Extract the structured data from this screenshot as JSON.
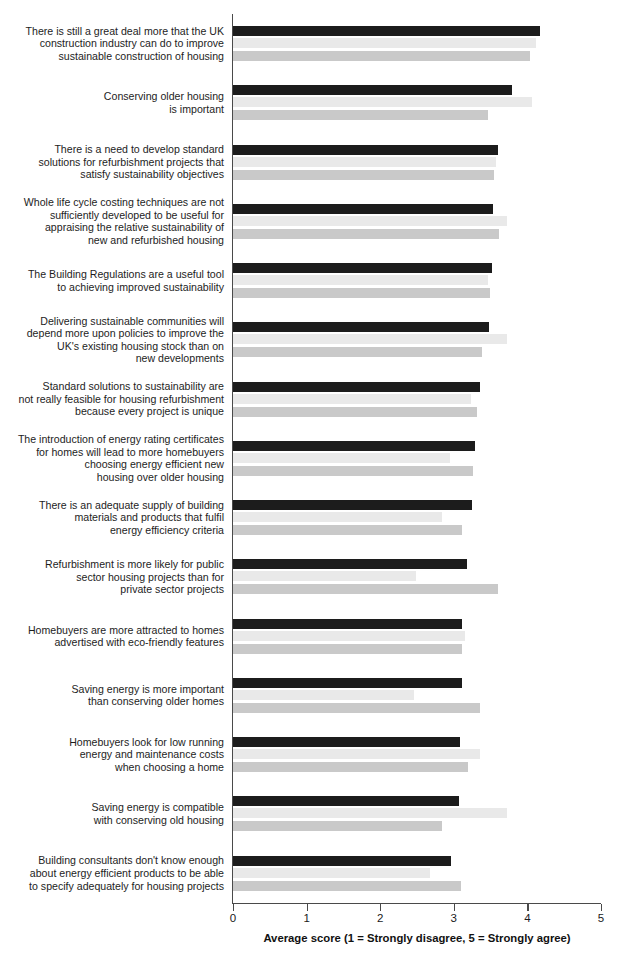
{
  "chart_data": {
    "type": "bar",
    "orientation": "horizontal",
    "title": "",
    "subtitle": "",
    "xlabel": "Average score (1 = Strongly disagree, 5 = Strongly agree)",
    "ylabel": "",
    "xlim": [
      0,
      5
    ],
    "xticks": [
      0,
      1,
      2,
      3,
      4,
      5
    ],
    "xtick_labels": [
      "0",
      "1",
      "2",
      "3",
      "4",
      "5"
    ],
    "grid": false,
    "legend": "none",
    "colors": {
      "series_1": "#1c1c1c",
      "series_2": "#e9e9e9",
      "series_3": "#c9c9c9",
      "axis": "#4a4a4a",
      "text": "#1d1d1d",
      "background": "#ffffff"
    },
    "categories": [
      [
        "There is still a great deal more that the UK",
        "construction industry can do to improve",
        "sustainable construction of housing"
      ],
      [
        "Conserving older housing",
        "is important"
      ],
      [
        "There is a need to develop standard",
        "solutions for refurbishment projects that",
        "satisfy sustainability objectives"
      ],
      [
        "Whole life cycle costing techniques are not",
        "sufficiently developed to be useful for",
        "appraising the relative sustainability of",
        "new and refurbished housing"
      ],
      [
        "The Building Regulations are a useful tool",
        "to achieving improved sustainability"
      ],
      [
        "Delivering sustainable communities will",
        "depend more upon policies to improve the",
        "UK's existing housing stock than on",
        "new developments"
      ],
      [
        "Standard solutions to sustainability are",
        "not really feasible for housing refurbishment",
        "because every project is unique"
      ],
      [
        "The introduction of energy rating certificates",
        "for homes will lead to more homebuyers",
        "choosing energy efficient new",
        "housing over older housing"
      ],
      [
        "There is an adequate supply of building",
        "materials and products that fulfil",
        "energy efficiency criteria"
      ],
      [
        "Refurbishment is more likely for public",
        "sector housing projects than for",
        "private sector projects"
      ],
      [
        "Homebuyers are more attracted to homes",
        "advertised with eco-friendly features"
      ],
      [
        "Saving energy is more important",
        "than conserving older homes"
      ],
      [
        "Homebuyers look for low running",
        "energy and maintenance costs",
        "when choosing a home"
      ],
      [
        "Saving energy is compatible",
        "with conserving old housing"
      ],
      [
        "Building consultants don't know enough",
        "about energy efficient products to be able",
        "to specify adequately for housing projects"
      ]
    ],
    "series": [
      {
        "name": "series_1",
        "color": "#1c1c1c",
        "values": [
          4.17,
          3.79,
          3.6,
          3.53,
          3.52,
          3.48,
          3.36,
          3.29,
          3.25,
          3.18,
          3.11,
          3.11,
          3.08,
          3.07,
          2.96
        ]
      },
      {
        "name": "series_2",
        "color": "#e9e9e9",
        "values": [
          4.12,
          4.06,
          3.57,
          3.72,
          3.46,
          3.72,
          3.23,
          2.95,
          2.84,
          2.49,
          3.15,
          2.46,
          3.36,
          3.72,
          2.67
        ]
      },
      {
        "name": "series_3",
        "color": "#c9c9c9",
        "values": [
          4.03,
          3.46,
          3.54,
          3.62,
          3.49,
          3.38,
          3.32,
          3.26,
          3.11,
          3.6,
          3.11,
          3.36,
          3.19,
          2.84,
          3.1
        ]
      }
    ]
  }
}
